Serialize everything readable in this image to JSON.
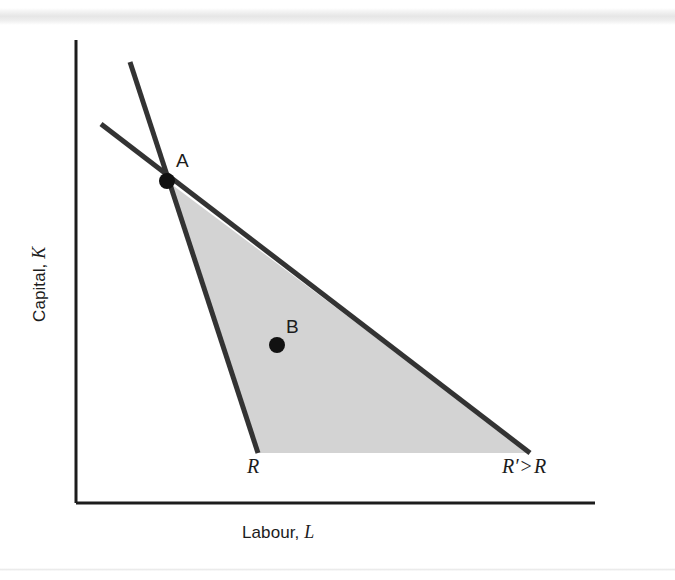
{
  "figure": {
    "type": "economics-isocost-diagram",
    "background_color": "#ffffff",
    "line_color": "#333333",
    "fill_color": "#d3d3d3",
    "axis_color": "#1c1c1c"
  },
  "axes": {
    "y": {
      "label_text": "Capital, ",
      "label_var": "K",
      "x": 76,
      "y_top": 40,
      "y_bottom": 503
    },
    "x": {
      "label_text": "Labour, ",
      "label_var": "L",
      "y": 503,
      "x_left": 76,
      "x_right": 595
    }
  },
  "points": [
    {
      "id": "A",
      "label": "A",
      "cx": 167,
      "cy": 181,
      "r": 8
    },
    {
      "id": "B",
      "label": "B",
      "cx": 277,
      "cy": 345,
      "r": 8
    }
  ],
  "lines": [
    {
      "id": "isocost-R",
      "name": "steep-isocost",
      "x1": 130,
      "y1": 62,
      "x2": 258,
      "y2": 453,
      "width": 5
    },
    {
      "id": "isocost-Rp",
      "name": "shallow-isocost",
      "x1": 101,
      "y1": 124,
      "x2": 530,
      "y2": 453,
      "width": 5
    }
  ],
  "shaded_region": {
    "name": "feasible-expansion-area",
    "points": "167,181 258,453 530,453"
  },
  "annotations": {
    "R": {
      "text": "R"
    },
    "R_prime": {
      "var": "R",
      "prime": "′",
      "relation": ">",
      "compare": "R"
    }
  },
  "chart_data": {
    "type": "line",
    "title": "",
    "xlabel": "Labour, L",
    "ylabel": "Capital, K",
    "grid": false,
    "legend": null,
    "annotations": [
      "A",
      "B",
      "R",
      "R′ > R"
    ],
    "series": [
      {
        "name": "R",
        "x": [
          130,
          258
        ],
        "y": [
          62,
          453
        ],
        "style": "steep isocost line"
      },
      {
        "name": "R′",
        "x": [
          101,
          530
        ],
        "y": [
          124,
          453
        ],
        "style": "shallow isocost line"
      }
    ],
    "markers": [
      {
        "label": "A",
        "x": 167,
        "y": 181
      },
      {
        "label": "B",
        "x": 277,
        "y": 345
      }
    ],
    "shaded_polygon": [
      [
        167,
        181
      ],
      [
        258,
        453
      ],
      [
        530,
        453
      ]
    ]
  }
}
